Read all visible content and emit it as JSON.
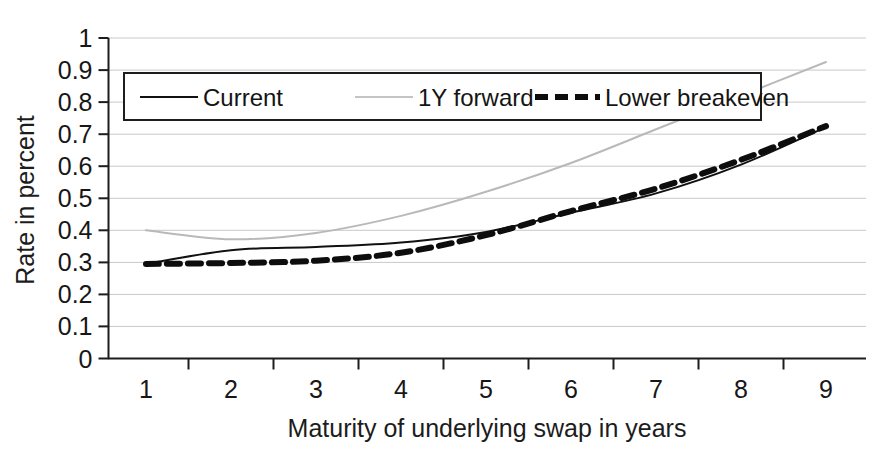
{
  "chart_data": {
    "type": "line",
    "title": "",
    "subtitle": "",
    "xlabel": "Maturity of underlying swap in years",
    "ylabel": "Rate in percent",
    "xlim": [
      1,
      9.4
    ],
    "ylim": [
      0,
      1
    ],
    "grid": true,
    "grid_axis": "y",
    "legend_position": "upper-left-inside",
    "x_ticks": [
      "1",
      "2",
      "3",
      "4",
      "5",
      "6",
      "7",
      "8",
      "9"
    ],
    "x_tick_values": [
      1,
      2,
      3,
      4,
      5,
      6,
      7,
      8,
      9
    ],
    "y_ticks": [
      "0",
      "0.1",
      "0.2",
      "0.3",
      "0.4",
      "0.5",
      "0.6",
      "0.7",
      "0.8",
      "0.9",
      "1"
    ],
    "y_tick_values": [
      0,
      0.1,
      0.2,
      0.3,
      0.4,
      0.5,
      0.6,
      0.7,
      0.8,
      0.9,
      1
    ],
    "x": [
      1,
      2,
      3,
      4,
      5,
      6,
      7,
      8,
      9
    ],
    "series": [
      {
        "name": "Current",
        "style": "solid",
        "color": "#111111",
        "width": 2,
        "values": [
          0.295,
          0.338,
          0.348,
          0.362,
          0.395,
          0.455,
          0.515,
          0.605,
          0.722
        ]
      },
      {
        "name": "1Y forward",
        "style": "solid",
        "color": "#b9b9b9",
        "width": 2,
        "values": [
          0.4,
          0.372,
          0.392,
          0.445,
          0.52,
          0.61,
          0.715,
          0.82,
          0.925
        ]
      },
      {
        "name": "Lower breakeven",
        "style": "dashed",
        "color": "#0d0d0d",
        "width": 6,
        "values": [
          0.295,
          0.298,
          0.305,
          0.33,
          0.385,
          0.46,
          0.53,
          0.62,
          0.725
        ]
      }
    ]
  },
  "legend": {
    "entries": [
      {
        "label": "Current",
        "sample": "solid-thin-black"
      },
      {
        "label": "1Y forward",
        "sample": "solid-thin-gray"
      },
      {
        "label": "Lower breakeven",
        "sample": "dashed-thick-black"
      }
    ]
  },
  "axes": {
    "y_title": "Rate in percent",
    "x_title": "Maturity of underlying swap in years"
  }
}
